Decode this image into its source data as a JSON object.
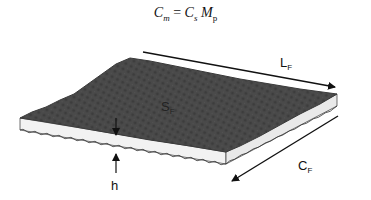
{
  "formula": {
    "lhs": "C",
    "lhs_sub": "m",
    "eq": " = ",
    "r1": "C",
    "r1_sub": "s",
    "r2": " M",
    "r2_sub": "p"
  },
  "labels": {
    "length": "L",
    "length_sub": "F",
    "width": "C",
    "width_sub": "F",
    "surface": "S",
    "surface_sub": "F",
    "thickness": "h"
  },
  "colors": {
    "top_surface": "#4a4a4a",
    "side_faces": "#f2f2f2",
    "lines": "#111111"
  }
}
